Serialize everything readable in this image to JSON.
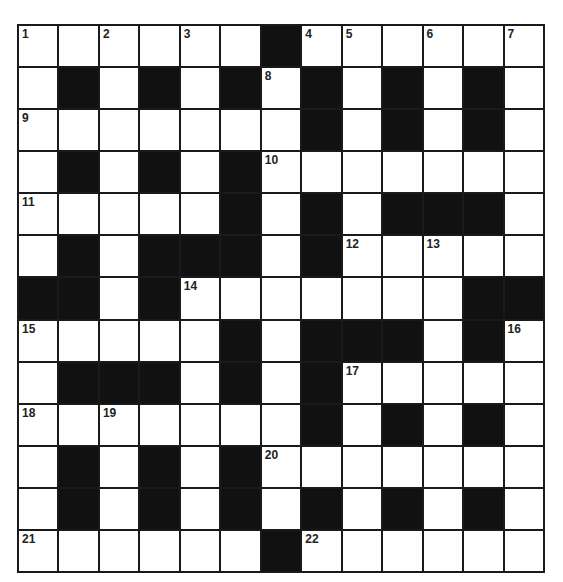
{
  "puzzle": {
    "type": "crossword",
    "rows": 13,
    "cols": 13,
    "colors": {
      "black": "#111111",
      "white": "#ffffff",
      "border": "#1a1a1a"
    },
    "grid": [
      "......#......",
      ".#.#.#.#.#.#.",
      ".......#.#.#.",
      ".#.#.#.......",
      ".....#.#.###.",
      ".#.###.#.....",
      "##.#.......##",
      ".....#.###.#.",
      ".###.#.#.....",
      ".......#.#.#.",
      ".#.#.#.......",
      ".#.#.#.#.#.#.",
      "......#......"
    ],
    "numbers": [
      {
        "r": 0,
        "c": 0,
        "n": "1"
      },
      {
        "r": 0,
        "c": 2,
        "n": "2"
      },
      {
        "r": 0,
        "c": 4,
        "n": "3"
      },
      {
        "r": 0,
        "c": 7,
        "n": "4"
      },
      {
        "r": 0,
        "c": 8,
        "n": "5"
      },
      {
        "r": 0,
        "c": 10,
        "n": "6"
      },
      {
        "r": 0,
        "c": 12,
        "n": "7"
      },
      {
        "r": 1,
        "c": 6,
        "n": "8"
      },
      {
        "r": 2,
        "c": 0,
        "n": "9"
      },
      {
        "r": 3,
        "c": 6,
        "n": "10"
      },
      {
        "r": 4,
        "c": 0,
        "n": "11"
      },
      {
        "r": 5,
        "c": 8,
        "n": "12"
      },
      {
        "r": 5,
        "c": 10,
        "n": "13"
      },
      {
        "r": 6,
        "c": 4,
        "n": "14"
      },
      {
        "r": 7,
        "c": 0,
        "n": "15"
      },
      {
        "r": 7,
        "c": 12,
        "n": "16"
      },
      {
        "r": 8,
        "c": 8,
        "n": "17"
      },
      {
        "r": 9,
        "c": 0,
        "n": "18"
      },
      {
        "r": 9,
        "c": 2,
        "n": "19"
      },
      {
        "r": 10,
        "c": 6,
        "n": "20"
      },
      {
        "r": 12,
        "c": 0,
        "n": "21"
      },
      {
        "r": 12,
        "c": 7,
        "n": "22"
      }
    ]
  }
}
